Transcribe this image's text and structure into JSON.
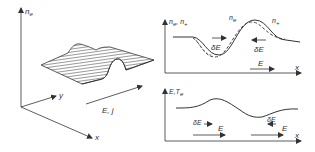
{
  "left_panel": {
    "axis_vertical": "n",
    "axis_vertical_sub": "e",
    "axis_y": "y",
    "axis_x": "x",
    "arrow_label": "E, j"
  },
  "top_right_panel": {
    "axis_vertical": "n",
    "axis_vertical_sub": "e",
    "axis_vertical_2": ", n",
    "axis_vertical_2_sub": "+",
    "axis_x": "x",
    "curve_labels": {
      "ne": "n",
      "ne_sub": "e",
      "np": "n",
      "np_sub": "+"
    },
    "delta_e_left": "δE",
    "delta_e_right": "δE",
    "field_label": "E"
  },
  "bottom_right_panel": {
    "axis_vertical": "E,T",
    "axis_vertical_sub": "e",
    "axis_x": "x",
    "delta_e_left": "δE",
    "delta_e_right": "δE",
    "field_left": "E",
    "field_right": "E"
  },
  "colors": {
    "line": "#333333",
    "hatch": "#555555",
    "background": "#ffffff"
  }
}
